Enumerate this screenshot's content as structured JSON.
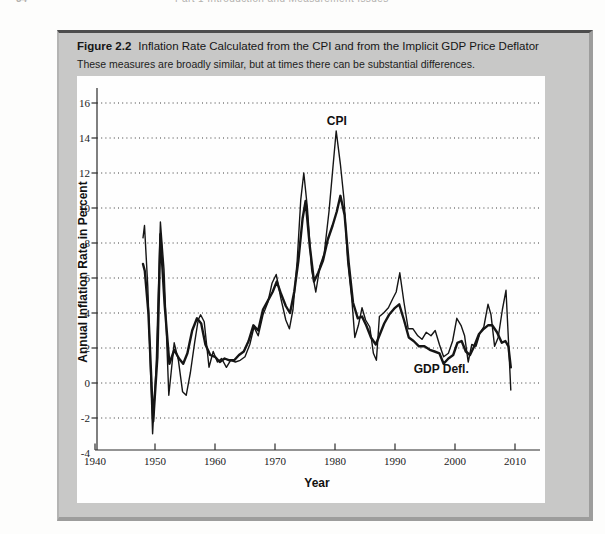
{
  "page_header": {
    "page_number": "34",
    "running_title": "Part 1 Introduction and Measurement Issues"
  },
  "figure": {
    "label": "Figure 2.2",
    "title": "Inflation Rate Calculated from the CPI and from the Implicit GDP Price Deflator",
    "caption": "These measures are broadly similar, but at times there can be substantial differences."
  },
  "colors": {
    "panel_background": "#c8c8c7",
    "panel_top_border": "#4d4d4d",
    "panel_shadow_border": "#9d9d9c",
    "plot_background": "#fefefe",
    "line_color": "#151515"
  },
  "chart_data": {
    "type": "line",
    "title": "",
    "xlabel": "Year",
    "ylabel": "Annual Inflation Rate in Percent",
    "xlim": [
      1940,
      2014
    ],
    "ylim": [
      -4,
      16
    ],
    "x_ticks": [
      1940,
      1950,
      1960,
      1970,
      1980,
      1990,
      2000,
      2010
    ],
    "y_ticks": [
      -4,
      -2,
      0,
      2,
      4,
      6,
      8,
      10,
      12,
      14,
      16
    ],
    "grid": "horizontal dotted lines at y ticks from -2 to 16",
    "legend_position": "in-plot text annotations",
    "annotations": [
      {
        "text": "CPI",
        "x": 1980.3,
        "y": 14.75
      },
      {
        "text": "GDP Defl.",
        "x": 1997.7,
        "y": 0.55
      }
    ],
    "series": [
      {
        "name": "CPI",
        "line_weight": "thin",
        "points": [
          [
            1948.0,
            8.3
          ],
          [
            1948.25,
            9.0
          ],
          [
            1948.8,
            5.5
          ],
          [
            1949.6,
            -2.9
          ],
          [
            1950.2,
            1.0
          ],
          [
            1950.9,
            9.2
          ],
          [
            1951.5,
            6.5
          ],
          [
            1952.3,
            -0.7
          ],
          [
            1953.2,
            2.3
          ],
          [
            1953.9,
            1.3
          ],
          [
            1954.6,
            -0.5
          ],
          [
            1955.2,
            -0.7
          ],
          [
            1955.9,
            0.6
          ],
          [
            1956.6,
            2.3
          ],
          [
            1957.2,
            3.6
          ],
          [
            1957.6,
            3.9
          ],
          [
            1958.2,
            3.5
          ],
          [
            1959.0,
            0.9
          ],
          [
            1959.7,
            1.8
          ],
          [
            1960.4,
            1.2
          ],
          [
            1961.1,
            1.4
          ],
          [
            1961.9,
            0.9
          ],
          [
            1962.6,
            1.3
          ],
          [
            1963.4,
            1.2
          ],
          [
            1964.2,
            1.3
          ],
          [
            1965.0,
            1.5
          ],
          [
            1965.8,
            2.2
          ],
          [
            1966.5,
            3.2
          ],
          [
            1967.2,
            2.7
          ],
          [
            1968.0,
            3.9
          ],
          [
            1968.8,
            4.6
          ],
          [
            1969.5,
            5.7
          ],
          [
            1970.2,
            6.2
          ],
          [
            1971.0,
            4.8
          ],
          [
            1971.8,
            3.6
          ],
          [
            1972.4,
            3.1
          ],
          [
            1973.0,
            4.2
          ],
          [
            1973.7,
            7.0
          ],
          [
            1974.3,
            10.5
          ],
          [
            1974.8,
            12.0
          ],
          [
            1975.4,
            10.0
          ],
          [
            1976.1,
            6.5
          ],
          [
            1976.8,
            5.2
          ],
          [
            1977.5,
            6.7
          ],
          [
            1978.2,
            7.4
          ],
          [
            1979.0,
            9.8
          ],
          [
            1979.7,
            12.5
          ],
          [
            1980.2,
            14.4
          ],
          [
            1980.9,
            12.5
          ],
          [
            1981.5,
            10.5
          ],
          [
            1982.1,
            7.0
          ],
          [
            1982.8,
            4.8
          ],
          [
            1983.3,
            2.6
          ],
          [
            1983.9,
            3.3
          ],
          [
            1984.5,
            4.3
          ],
          [
            1985.1,
            3.6
          ],
          [
            1985.8,
            3.2
          ],
          [
            1986.4,
            1.7
          ],
          [
            1986.9,
            1.3
          ],
          [
            1987.4,
            3.8
          ],
          [
            1988.1,
            4.0
          ],
          [
            1988.9,
            4.3
          ],
          [
            1989.6,
            4.8
          ],
          [
            1990.2,
            5.2
          ],
          [
            1990.8,
            6.3
          ],
          [
            1991.5,
            4.6
          ],
          [
            1992.2,
            3.1
          ],
          [
            1993.0,
            3.1
          ],
          [
            1993.8,
            2.7
          ],
          [
            1994.5,
            2.5
          ],
          [
            1995.2,
            2.9
          ],
          [
            1996.0,
            2.7
          ],
          [
            1996.7,
            3.0
          ],
          [
            1997.4,
            2.2
          ],
          [
            1998.1,
            1.5
          ],
          [
            1998.9,
            1.7
          ],
          [
            1999.6,
            2.4
          ],
          [
            2000.3,
            3.7
          ],
          [
            2001.0,
            3.3
          ],
          [
            2001.6,
            2.7
          ],
          [
            2002.2,
            1.2
          ],
          [
            2002.8,
            2.2
          ],
          [
            2003.5,
            2.1
          ],
          [
            2004.2,
            2.9
          ],
          [
            2004.8,
            3.2
          ],
          [
            2005.5,
            4.5
          ],
          [
            2006.0,
            3.9
          ],
          [
            2006.6,
            2.1
          ],
          [
            2007.2,
            2.6
          ],
          [
            2007.9,
            4.2
          ],
          [
            2008.5,
            5.3
          ],
          [
            2008.9,
            2.5
          ],
          [
            2009.3,
            -0.4
          ]
        ]
      },
      {
        "name": "GDP Deflator",
        "line_weight": "thick",
        "points": [
          [
            1948.0,
            6.8
          ],
          [
            1948.3,
            6.4
          ],
          [
            1948.9,
            4.0
          ],
          [
            1949.7,
            -2.2
          ],
          [
            1950.4,
            1.5
          ],
          [
            1950.9,
            8.5
          ],
          [
            1951.6,
            4.5
          ],
          [
            1952.4,
            1.1
          ],
          [
            1953.2,
            1.9
          ],
          [
            1954.0,
            1.4
          ],
          [
            1954.7,
            1.1
          ],
          [
            1955.4,
            1.7
          ],
          [
            1956.2,
            3.0
          ],
          [
            1957.0,
            3.7
          ],
          [
            1957.7,
            3.4
          ],
          [
            1958.4,
            2.2
          ],
          [
            1959.2,
            1.6
          ],
          [
            1960.0,
            1.5
          ],
          [
            1960.8,
            1.2
          ],
          [
            1961.6,
            1.4
          ],
          [
            1962.4,
            1.3
          ],
          [
            1963.2,
            1.3
          ],
          [
            1964.0,
            1.6
          ],
          [
            1964.8,
            1.8
          ],
          [
            1965.6,
            2.4
          ],
          [
            1966.4,
            3.3
          ],
          [
            1967.2,
            3.0
          ],
          [
            1968.0,
            4.2
          ],
          [
            1968.8,
            4.7
          ],
          [
            1969.6,
            5.2
          ],
          [
            1970.3,
            5.8
          ],
          [
            1971.0,
            5.1
          ],
          [
            1971.8,
            4.4
          ],
          [
            1972.5,
            4.0
          ],
          [
            1973.2,
            5.2
          ],
          [
            1973.9,
            7.0
          ],
          [
            1974.6,
            9.4
          ],
          [
            1975.1,
            10.4
          ],
          [
            1975.8,
            7.8
          ],
          [
            1976.5,
            5.8
          ],
          [
            1977.2,
            6.3
          ],
          [
            1978.0,
            7.0
          ],
          [
            1978.8,
            8.2
          ],
          [
            1979.6,
            9.0
          ],
          [
            1980.3,
            9.8
          ],
          [
            1980.9,
            10.7
          ],
          [
            1981.6,
            9.6
          ],
          [
            1982.3,
            6.8
          ],
          [
            1983.0,
            4.6
          ],
          [
            1983.8,
            3.7
          ],
          [
            1984.5,
            3.8
          ],
          [
            1985.2,
            3.3
          ],
          [
            1986.0,
            2.6
          ],
          [
            1986.8,
            2.2
          ],
          [
            1987.5,
            2.8
          ],
          [
            1988.2,
            3.4
          ],
          [
            1989.0,
            3.9
          ],
          [
            1990.0,
            4.3
          ],
          [
            1990.7,
            4.5
          ],
          [
            1991.5,
            3.6
          ],
          [
            1992.3,
            2.6
          ],
          [
            1993.1,
            2.4
          ],
          [
            1994.0,
            2.1
          ],
          [
            1994.9,
            2.1
          ],
          [
            1995.8,
            1.9
          ],
          [
            1996.6,
            1.8
          ],
          [
            1997.4,
            1.7
          ],
          [
            1998.1,
            1.1
          ],
          [
            1998.9,
            1.4
          ],
          [
            1999.7,
            1.6
          ],
          [
            2000.4,
            2.3
          ],
          [
            2001.1,
            2.4
          ],
          [
            2001.8,
            1.8
          ],
          [
            2002.5,
            1.6
          ],
          [
            2003.2,
            2.1
          ],
          [
            2004.0,
            2.8
          ],
          [
            2004.8,
            3.1
          ],
          [
            2005.5,
            3.3
          ],
          [
            2006.2,
            3.3
          ],
          [
            2007.0,
            2.9
          ],
          [
            2007.8,
            2.3
          ],
          [
            2008.4,
            2.4
          ],
          [
            2008.9,
            2.1
          ],
          [
            2009.3,
            0.9
          ]
        ]
      }
    ]
  }
}
